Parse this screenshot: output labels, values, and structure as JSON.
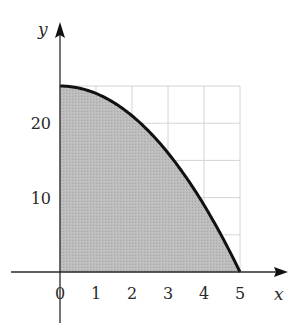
{
  "chart_data": {
    "type": "area",
    "title": "",
    "xlabel": "x",
    "ylabel": "y",
    "function": "y = 25 - x^2",
    "x": [
      0,
      0.5,
      1,
      1.5,
      2,
      2.5,
      3,
      3.5,
      4,
      4.5,
      5
    ],
    "series": [
      {
        "name": "y = 25 - x^2",
        "values": [
          25,
          24.75,
          24,
          22.75,
          21,
          18.75,
          16,
          12.75,
          9,
          4.75,
          0
        ]
      }
    ],
    "xlim": [
      0,
      5
    ],
    "ylim": [
      0,
      25
    ],
    "x_ticks": [
      "0",
      "1",
      "2",
      "3",
      "4",
      "5"
    ],
    "y_ticks": [
      "10",
      "20"
    ],
    "grid": true,
    "grid_x_step": 1,
    "grid_y_step": 5,
    "shaded_region": "area under curve from x=0 to x=5",
    "legend": null
  },
  "colors": {
    "fill": "#b9b9b9",
    "curve": "#111111",
    "grid": "#d4d4d4",
    "axis": "#2a2a2a"
  }
}
